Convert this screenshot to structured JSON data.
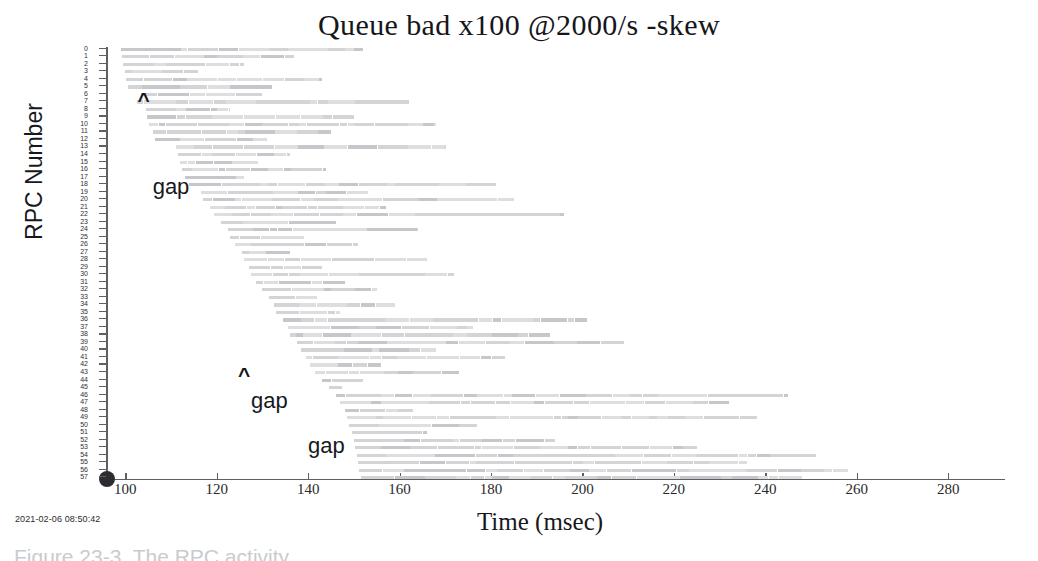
{
  "figure": {
    "title": "Queue bad x100 @2000/s -skew",
    "timestamp": "2021-02-06 08:50:42",
    "caption": "Figure 23-3.  The RPC activity"
  },
  "chart_data": {
    "type": "bar",
    "title": "Queue bad x100 @2000/s -skew",
    "xlabel": "Time (msec)",
    "ylabel": "RPC Number",
    "orientation": "horizontal",
    "grid": false,
    "legend": null,
    "xlim": [
      96,
      292
    ],
    "ylim": [
      -0.5,
      57.5
    ],
    "xticks": [
      100,
      120,
      140,
      160,
      180,
      200,
      220,
      240,
      260,
      280
    ],
    "xticklabels": [
      "100",
      "120",
      "140",
      "160",
      "180",
      "200",
      "220",
      "240",
      "260",
      "280"
    ],
    "yticks": [
      0,
      1,
      2,
      3,
      4,
      5,
      6,
      7,
      8,
      9,
      10,
      11,
      12,
      13,
      14,
      15,
      16,
      17,
      18,
      19,
      20,
      21,
      22,
      23,
      24,
      25,
      26,
      27,
      28,
      29,
      30,
      31,
      32,
      33,
      34,
      35,
      36,
      37,
      38,
      39,
      40,
      41,
      42,
      43,
      44,
      45,
      46,
      47,
      48,
      49,
      50,
      51,
      52,
      53,
      54,
      55,
      56,
      57
    ],
    "bars": [
      {
        "rpc": 0,
        "start": 99.0,
        "end": 152.0
      },
      {
        "rpc": 1,
        "start": 99.3,
        "end": 137.0
      },
      {
        "rpc": 2,
        "start": 99.6,
        "end": 126.0
      },
      {
        "rpc": 3,
        "start": 99.9,
        "end": 116.0
      },
      {
        "rpc": 4,
        "start": 100.2,
        "end": 143.0
      },
      {
        "rpc": 5,
        "start": 100.5,
        "end": 132.0
      },
      {
        "rpc": 6,
        "start": 103.5,
        "end": 130.0
      },
      {
        "rpc": 7,
        "start": 102.5,
        "end": 162.0
      },
      {
        "rpc": 8,
        "start": 104.5,
        "end": 123.0
      },
      {
        "rpc": 9,
        "start": 104.8,
        "end": 150.0
      },
      {
        "rpc": 10,
        "start": 105.2,
        "end": 168.0
      },
      {
        "rpc": 11,
        "start": 106.0,
        "end": 145.0
      },
      {
        "rpc": 12,
        "start": 106.5,
        "end": 131.0
      },
      {
        "rpc": 13,
        "start": 111.0,
        "end": 170.0
      },
      {
        "rpc": 14,
        "start": 111.5,
        "end": 136.0
      },
      {
        "rpc": 15,
        "start": 112.0,
        "end": 129.0
      },
      {
        "rpc": 16,
        "start": 112.5,
        "end": 144.0
      },
      {
        "rpc": 17,
        "start": 113.0,
        "end": 126.0
      },
      {
        "rpc": 18,
        "start": 114.0,
        "end": 181.0
      },
      {
        "rpc": 19,
        "start": 116.5,
        "end": 153.0
      },
      {
        "rpc": 20,
        "start": 117.0,
        "end": 185.0
      },
      {
        "rpc": 21,
        "start": 118.5,
        "end": 157.0
      },
      {
        "rpc": 22,
        "start": 119.5,
        "end": 196.0
      },
      {
        "rpc": 23,
        "start": 121.0,
        "end": 146.0
      },
      {
        "rpc": 24,
        "start": 122.5,
        "end": 164.0
      },
      {
        "rpc": 25,
        "start": 123.0,
        "end": 139.0
      },
      {
        "rpc": 26,
        "start": 124.0,
        "end": 151.0
      },
      {
        "rpc": 27,
        "start": 125.5,
        "end": 136.0
      },
      {
        "rpc": 28,
        "start": 126.0,
        "end": 166.0
      },
      {
        "rpc": 29,
        "start": 127.0,
        "end": 143.0
      },
      {
        "rpc": 30,
        "start": 127.5,
        "end": 172.0
      },
      {
        "rpc": 31,
        "start": 128.5,
        "end": 148.0
      },
      {
        "rpc": 32,
        "start": 130.0,
        "end": 155.0
      },
      {
        "rpc": 33,
        "start": 131.5,
        "end": 142.0
      },
      {
        "rpc": 34,
        "start": 132.5,
        "end": 159.0
      },
      {
        "rpc": 35,
        "start": 133.0,
        "end": 147.0
      },
      {
        "rpc": 36,
        "start": 134.5,
        "end": 201.0
      },
      {
        "rpc": 37,
        "start": 135.5,
        "end": 176.0
      },
      {
        "rpc": 38,
        "start": 136.0,
        "end": 193.0
      },
      {
        "rpc": 39,
        "start": 137.5,
        "end": 209.0
      },
      {
        "rpc": 40,
        "start": 138.5,
        "end": 168.0
      },
      {
        "rpc": 41,
        "start": 139.5,
        "end": 183.0
      },
      {
        "rpc": 42,
        "start": 140.5,
        "end": 156.0
      },
      {
        "rpc": 43,
        "start": 141.5,
        "end": 173.0
      },
      {
        "rpc": 44,
        "start": 143.0,
        "end": 152.0
      },
      {
        "rpc": 45,
        "start": 144.5,
        "end": 147.5
      },
      {
        "rpc": 46,
        "start": 146.0,
        "end": 245.0
      },
      {
        "rpc": 47,
        "start": 147.0,
        "end": 232.0
      },
      {
        "rpc": 48,
        "start": 148.0,
        "end": 163.0
      },
      {
        "rpc": 49,
        "start": 148.5,
        "end": 238.0
      },
      {
        "rpc": 50,
        "start": 149.0,
        "end": 177.0
      },
      {
        "rpc": 51,
        "start": 149.5,
        "end": 166.0
      },
      {
        "rpc": 52,
        "start": 150.0,
        "end": 194.0
      },
      {
        "rpc": 53,
        "start": 150.3,
        "end": 225.0
      },
      {
        "rpc": 54,
        "start": 150.6,
        "end": 251.0
      },
      {
        "rpc": 55,
        "start": 150.9,
        "end": 236.0
      },
      {
        "rpc": 56,
        "start": 151.2,
        "end": 258.0
      },
      {
        "rpc": 57,
        "start": 151.5,
        "end": 248.0
      }
    ],
    "annotations": [
      {
        "label": "^",
        "x": 104.0,
        "rpc": 7.0,
        "kind": "caret"
      },
      {
        "label": "gap",
        "x": 110.0,
        "rpc": 18.5,
        "kind": "text"
      },
      {
        "label": "^",
        "x": 126.0,
        "rpc": 43.5,
        "kind": "caret"
      },
      {
        "label": "gap",
        "x": 131.5,
        "rpc": 47.0,
        "kind": "text"
      },
      {
        "label": "gap",
        "x": 144.0,
        "rpc": 53.0,
        "kind": "text"
      }
    ]
  },
  "colors": {
    "bar": "#d3d4d6",
    "bar_light": "#dddee0",
    "bar_dark": "#c6c7ca",
    "axis": "#5d5f62",
    "text": "#17181c"
  }
}
